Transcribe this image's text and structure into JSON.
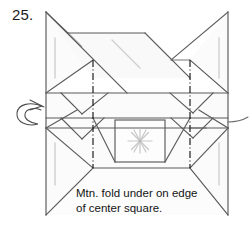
{
  "diagram": {
    "step_number": "25.",
    "caption": "Mtn. fold under on edge\nof center square.",
    "type": "origami-instruction-diagram",
    "colors": {
      "paper_fill": "#fbfbfb",
      "paper_fill_light": "#f7f7f7",
      "edge_stroke": "#4a4a4a",
      "crease_stroke": "#8e8e8e",
      "mountain_fold_stroke": "#1e1e1e",
      "ghost_crease_stroke": "#c2c2c2",
      "text": "#141414"
    },
    "annotations": {
      "turn_over_arrow": "turn-over-loop-arrow",
      "mountain_fold_lines": 2,
      "center_mark": "asterisk-starburst"
    },
    "labels": {
      "left_edge": "left-panel-edge",
      "right_edge": "right-panel-edge",
      "center_square": "center-square"
    }
  }
}
